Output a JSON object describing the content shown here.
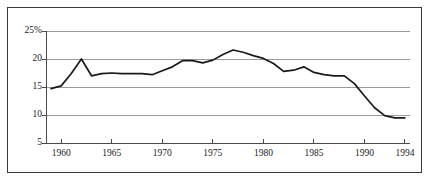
{
  "chart_data": {
    "type": "line",
    "title": "",
    "subtitle": "",
    "xlabel": "",
    "ylabel": "",
    "xlim": [
      1958.5,
      1994.5
    ],
    "ylim": [
      5,
      26
    ],
    "grid": true,
    "legend_position": "none",
    "yticks": [
      5,
      10,
      15,
      20,
      25
    ],
    "ytick_labels": [
      "5",
      "10",
      "15",
      "20",
      "25%"
    ],
    "xticks": [
      1960,
      1965,
      1970,
      1975,
      1980,
      1985,
      1990,
      1994
    ],
    "xtick_labels": [
      "1960",
      "1965",
      "1970",
      "1975",
      "1980",
      "1985",
      "1990",
      "1994"
    ],
    "series": [
      {
        "name": "Series 1",
        "color": "#1a1a1a",
        "x": [
          1959,
          1960,
          1961,
          1962,
          1963,
          1964,
          1965,
          1966,
          1967,
          1968,
          1969,
          1970,
          1971,
          1972,
          1973,
          1974,
          1975,
          1976,
          1977,
          1978,
          1979,
          1980,
          1981,
          1982,
          1983,
          1984,
          1985,
          1986,
          1987,
          1988,
          1989,
          1990,
          1991,
          1992,
          1993,
          1994
        ],
        "values": [
          14.7,
          15.2,
          17.4,
          20.0,
          17.0,
          17.4,
          17.5,
          17.4,
          17.4,
          17.4,
          17.2,
          17.9,
          18.6,
          19.7,
          19.7,
          19.3,
          19.8,
          20.8,
          21.6,
          21.2,
          20.6,
          20.1,
          19.2,
          17.8,
          18.0,
          18.6,
          17.6,
          17.2,
          17.0,
          17.0,
          15.6,
          13.4,
          11.3,
          9.9,
          9.5,
          9.5
        ]
      }
    ]
  },
  "axis": {
    "yticks": [
      {
        "label": "25%",
        "value": 25
      },
      {
        "label": "20",
        "value": 20
      },
      {
        "label": "15",
        "value": 15
      },
      {
        "label": "10",
        "value": 10
      },
      {
        "label": "5",
        "value": 5
      }
    ],
    "xticks": [
      {
        "label": "1960",
        "value": 1960
      },
      {
        "label": "1965",
        "value": 1965
      },
      {
        "label": "1970",
        "value": 1970
      },
      {
        "label": "1975",
        "value": 1975
      },
      {
        "label": "1980",
        "value": 1980
      },
      {
        "label": "1985",
        "value": 1985
      },
      {
        "label": "1990",
        "value": 1990
      },
      {
        "label": "1994",
        "value": 1994
      }
    ]
  },
  "style": {
    "line_color": "#1a1a1a",
    "grid_color": "#9a9a9a",
    "axis_color": "#4a4a4a",
    "frame_color": "#3a3a3a",
    "background": "#ffffff",
    "text_color": "#1a1a1a"
  }
}
